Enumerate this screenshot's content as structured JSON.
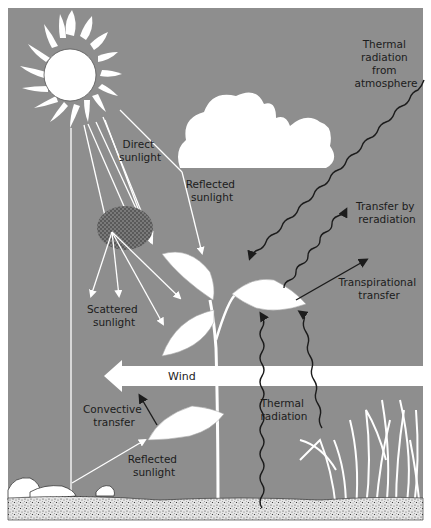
{
  "diagram": {
    "colors": {
      "sky_gray": "#8e8e8e",
      "white": "#ffffff",
      "ink": "#1c1c1c",
      "ground_speckle": "#444444",
      "ground_base": "#e4e4e4"
    },
    "labels": {
      "direct_sunlight": [
        "Direct",
        "sunlight"
      ],
      "reflected_sunlight_top": [
        "Reflected",
        "sunlight"
      ],
      "thermal_radiation_atmosphere": [
        "Thermal",
        "radiation",
        "from",
        "atmosphere"
      ],
      "transfer_by_reradiation": [
        "Transfer by",
        "reradiation"
      ],
      "transpirational_transfer": [
        "Transpirational",
        "transfer"
      ],
      "scattered_sunlight": [
        "Scattered",
        "sunlight"
      ],
      "wind": "Wind",
      "convective_transfer": [
        "Convective",
        "transfer"
      ],
      "reflected_sunlight_bottom": [
        "Reflected",
        "sunlight"
      ],
      "thermal_radiation_ground": [
        "Thermal",
        "radiation"
      ]
    },
    "elements": [
      "sun",
      "cloud",
      "dust-particle-cloud",
      "plant",
      "grass",
      "rocks",
      "ground",
      "wind-arrow"
    ]
  }
}
